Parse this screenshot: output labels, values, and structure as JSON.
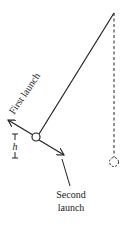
{
  "diagram": {
    "labels": {
      "first_launch": "First launch",
      "second_launch_line1": "Second",
      "second_launch_line2": "launch",
      "height": "h"
    },
    "elements": {
      "pivot": {
        "x": 114,
        "y": 13
      },
      "ball": {
        "x": 36,
        "y": 137,
        "r": 4
      },
      "hanging_ball": {
        "x": 114,
        "y": 162,
        "r": 4.5
      },
      "string": "solid line from pivot to ball",
      "vertical_reference": "dashed line from pivot to hanging ball",
      "first_launch_arrow": "from ball toward upper-left",
      "second_launch_arrow": "from ball toward lower-right",
      "height_marker": "vertical dimension h between ball level and lowest level"
    },
    "colors": {
      "stroke": "#222222",
      "background": "#ffffff"
    }
  }
}
